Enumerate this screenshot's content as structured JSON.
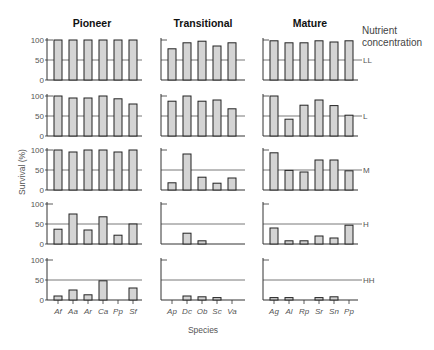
{
  "chart_data": {
    "type": "bar",
    "layout": "small-multiples grid (5 rows x 3 columns)",
    "ylabel": "Survival (%)",
    "xlabel": "Species",
    "ylim": [
      0,
      100
    ],
    "yticks": [
      0,
      50,
      100
    ],
    "reference_line": 50,
    "legend_title": "Nutrient concentration",
    "rows": [
      "LL",
      "L",
      "M",
      "H",
      "HH"
    ],
    "columns": [
      {
        "title": "Pioneer",
        "species": [
          "Af",
          "Aa",
          "Ar",
          "Ca",
          "Pp",
          "Sf"
        ],
        "values": {
          "LL": [
            100,
            100,
            100,
            100,
            100,
            100
          ],
          "L": [
            100,
            95,
            95,
            100,
            93,
            80
          ],
          "M": [
            100,
            95,
            100,
            100,
            95,
            100
          ],
          "H": [
            37,
            75,
            35,
            68,
            22,
            50
          ],
          "HH": [
            10,
            25,
            13,
            48,
            0,
            30
          ]
        }
      },
      {
        "title": "Transitional",
        "species": [
          "Ap",
          "Dc",
          "Ob",
          "Sc",
          "Va"
        ],
        "values": {
          "LL": [
            78,
            93,
            97,
            85,
            93
          ],
          "L": [
            87,
            100,
            87,
            90,
            68
          ],
          "M": [
            18,
            90,
            32,
            17,
            30
          ],
          "H": [
            0,
            27,
            8,
            0,
            0
          ],
          "HH": [
            0,
            10,
            8,
            6,
            0
          ]
        }
      },
      {
        "title": "Mature",
        "species": [
          "Ag",
          "Al",
          "Rp",
          "Sr",
          "Sn",
          "Pp"
        ],
        "values": {
          "LL": [
            98,
            93,
            93,
            98,
            95,
            98
          ],
          "L": [
            100,
            42,
            77,
            90,
            76,
            52
          ],
          "M": [
            93,
            49,
            45,
            75,
            75,
            48
          ],
          "H": [
            40,
            8,
            8,
            20,
            15,
            47
          ],
          "HH": [
            6,
            6,
            0,
            6,
            8,
            0
          ]
        }
      }
    ]
  },
  "colors": {
    "bar_fill": "#d4d4d4",
    "bar_stroke": "#222222",
    "axis": "#333333",
    "reference_line": "#555555",
    "text": "#555555",
    "title": "#111111"
  }
}
